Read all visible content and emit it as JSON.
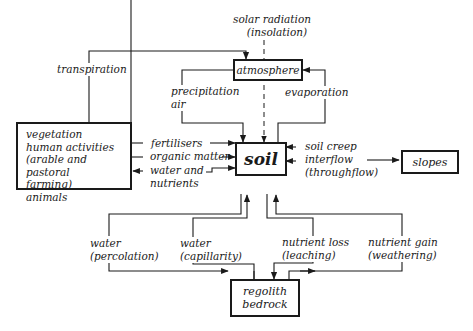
{
  "diagram": {
    "nodes": {
      "atmosphere": "atmosphere",
      "soil": "soil",
      "slopes": "slopes",
      "regolith": [
        "regolith",
        "bedrock"
      ],
      "vegetation": [
        "vegetation",
        "human activities",
        "(arable and pastoral",
        "farming)",
        "animals"
      ]
    },
    "labels": {
      "solar": [
        "solar radiation",
        "(insolation)"
      ],
      "transpiration": "transpiration",
      "precipitation": [
        "precipitation",
        "air"
      ],
      "evaporation": "evaporation",
      "fertilisers": "fertilisers",
      "organic_matter": "organic matter",
      "water_nutrients": [
        "water and",
        "nutrients"
      ],
      "soil_creep": [
        "soil creep",
        "interflow",
        "(throughflow)"
      ],
      "percolation": [
        "water",
        "(percolation)"
      ],
      "capillarity": [
        "water",
        "(capillarity)"
      ],
      "leaching": [
        "nutrient loss",
        "(leaching)"
      ],
      "weathering": [
        "nutrient gain",
        "(weathering)"
      ]
    },
    "colors": {
      "ink": "#1a1a1a",
      "background": "#ffffff"
    }
  }
}
